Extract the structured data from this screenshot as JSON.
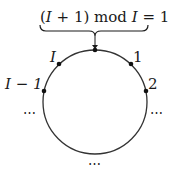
{
  "diagram": {
    "formula": {
      "open_paren": "(",
      "var1": "I",
      "plus": " + 1)",
      "mod": " mod ",
      "var2": "I",
      "eq": " = 1"
    },
    "circle": {
      "cx": 95,
      "cy": 102,
      "r": 52,
      "stroke": "#333333"
    },
    "points": [
      {
        "label": "I",
        "italic": true
      },
      {
        "label": "1",
        "italic": false
      },
      {
        "label": "I − 1",
        "italic": true
      },
      {
        "label": "2",
        "italic": false
      }
    ],
    "ellipses": {
      "left": "⋯",
      "right": "⋯",
      "bottom": "⋯"
    }
  }
}
